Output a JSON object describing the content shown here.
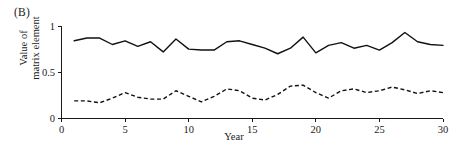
{
  "panel": {
    "label": "(B)"
  },
  "axes": {
    "ylabel_line1": "Value of",
    "ylabel_line2": "matrix element",
    "xlabel": "Year",
    "yticks": [
      "0",
      "0.5",
      "1"
    ],
    "xticks": [
      "0",
      "5",
      "10",
      "15",
      "20",
      "25",
      "30"
    ]
  },
  "chart_data": {
    "type": "line",
    "title": "",
    "subtitle": "",
    "panel_label": "(B)",
    "xlabel": "Year",
    "ylabel": "Value of matrix element",
    "xlim": [
      0,
      30
    ],
    "ylim": [
      0,
      1
    ],
    "xticks": [
      0,
      5,
      10,
      15,
      20,
      25,
      30
    ],
    "yticks": [
      0,
      0.5,
      1
    ],
    "grid": false,
    "legend": "none",
    "axis_style": "left-and-bottom-spines",
    "x": [
      1,
      2,
      3,
      4,
      5,
      6,
      7,
      8,
      9,
      10,
      11,
      12,
      13,
      14,
      15,
      16,
      17,
      18,
      19,
      20,
      21,
      22,
      23,
      24,
      25,
      26,
      27,
      28,
      29,
      30
    ],
    "series": [
      {
        "name": "upper",
        "style": "solid",
        "color": "#111111",
        "values": [
          0.84,
          0.87,
          0.87,
          0.8,
          0.84,
          0.78,
          0.83,
          0.72,
          0.86,
          0.75,
          0.74,
          0.74,
          0.83,
          0.84,
          0.8,
          0.76,
          0.7,
          0.76,
          0.88,
          0.71,
          0.79,
          0.82,
          0.76,
          0.79,
          0.74,
          0.82,
          0.93,
          0.83,
          0.8,
          0.79
        ]
      },
      {
        "name": "lower",
        "style": "dashed",
        "color": "#111111",
        "values": [
          0.19,
          0.19,
          0.17,
          0.22,
          0.28,
          0.23,
          0.21,
          0.21,
          0.3,
          0.24,
          0.18,
          0.24,
          0.32,
          0.3,
          0.22,
          0.2,
          0.26,
          0.35,
          0.36,
          0.28,
          0.22,
          0.3,
          0.32,
          0.28,
          0.3,
          0.34,
          0.31,
          0.27,
          0.3,
          0.28
        ]
      }
    ]
  }
}
